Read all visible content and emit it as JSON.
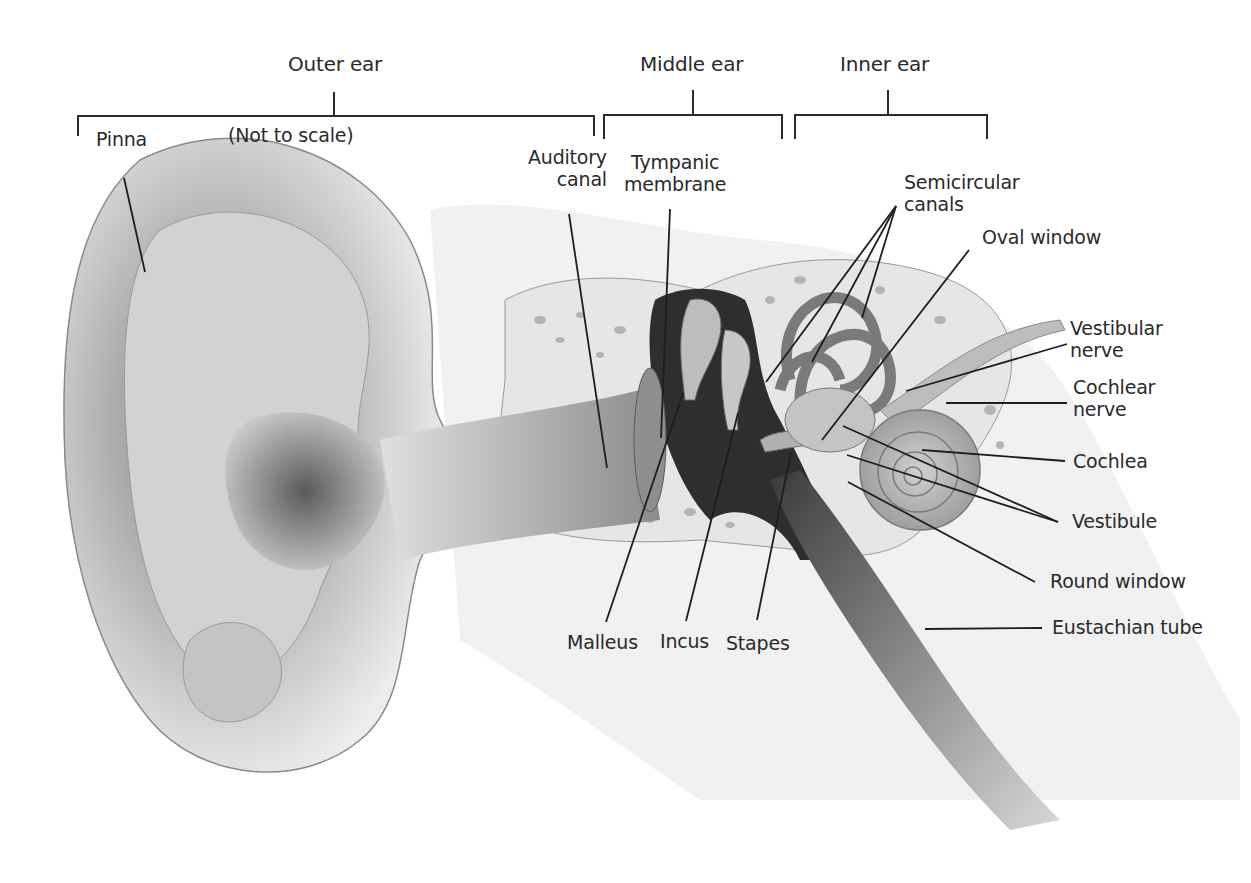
{
  "diagram": {
    "note": "(Not to scale)",
    "colors": {
      "line": "#2a2a2a",
      "text": "#2a2a2a",
      "background": "#ffffff",
      "shading_dark": "#3a3a3a",
      "shading_mid": "#9a9a9a",
      "shading_light": "#e2e2e2"
    },
    "regions": [
      {
        "id": "outer",
        "label": "Outer ear",
        "bracket_x": [
          78,
          594
        ]
      },
      {
        "id": "middle",
        "label": "Middle ear",
        "bracket_x": [
          604,
          782
        ]
      },
      {
        "id": "inner",
        "label": "Inner ear",
        "bracket_x": [
          795,
          987
        ]
      }
    ],
    "labels": {
      "pinna": "Pinna",
      "auditory_canal": "Auditory\ncanal",
      "tympanic_membrane": "Tympanic\nmembrane",
      "semicircular_canals": "Semicircular\ncanals",
      "oval_window": "Oval window",
      "vestibular_nerve": "Vestibular\nnerve",
      "cochlear_nerve": "Cochlear\nnerve",
      "cochlea": "Cochlea",
      "vestibule": "Vestibule",
      "round_window": "Round window",
      "eustachian_tube": "Eustachian tube",
      "malleus": "Malleus",
      "incus": "Incus",
      "stapes": "Stapes"
    }
  }
}
